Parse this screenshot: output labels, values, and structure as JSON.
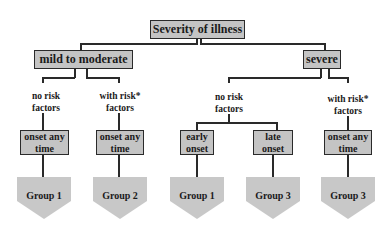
{
  "diagram": {
    "root": {
      "label": "Severity of illness"
    },
    "level1": [
      {
        "label": "mild to moderate"
      },
      {
        "label": "severe"
      }
    ],
    "criteria": [
      {
        "label_line1": "no risk",
        "label_line2": "factors"
      },
      {
        "label_line1": "with risk*",
        "label_line2": "factors"
      },
      {
        "label_line1": "no risk",
        "label_line2": "factors"
      },
      {
        "label_line1": "with risk*",
        "label_line2": "factors"
      }
    ],
    "onset": [
      {
        "label_line1": "onset any",
        "label_line2": "time"
      },
      {
        "label_line1": "onset any",
        "label_line2": "time"
      },
      {
        "label_line1": "early",
        "label_line2": "onset"
      },
      {
        "label_line1": "late",
        "label_line2": "onset"
      },
      {
        "label_line1": "onset any",
        "label_line2": "time"
      }
    ],
    "groups": [
      {
        "label": "Group 1"
      },
      {
        "label": "Group 2"
      },
      {
        "label": "Group 1"
      },
      {
        "label": "Group 3"
      },
      {
        "label": "Group 3"
      }
    ]
  },
  "colors": {
    "box_fill": "#c4c4c4",
    "pentagon_fill": "#c8c8c8",
    "line": "#2a2a2a",
    "text": "#1a1a1a"
  }
}
